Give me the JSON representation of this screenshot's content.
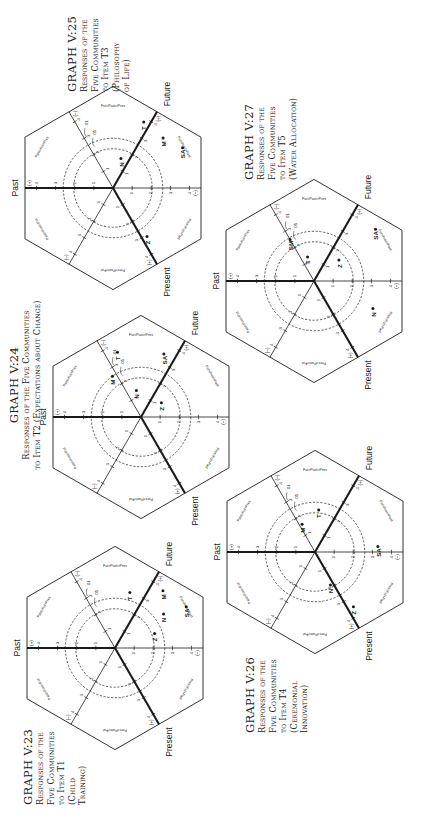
{
  "page": {
    "orientation": "rotated-90-ccw",
    "background": "#ffffff",
    "ink": "#1a1a1a"
  },
  "axes": {
    "past_label": "Past",
    "present_label": "Present",
    "future_label": "Future",
    "plus_marker": "(+)",
    "minus_marker": "(–)",
    "tick_labels": [
      "1",
      "2",
      "3",
      "4"
    ],
    "circle_01_label": ".01",
    "circle_05_label": ".05",
    "sector_labels": {
      "past_future_present": "Past>Fut>Pres",
      "future_past_present": "Fut>Past>Pres",
      "future_present_past": "Fut>Pres>Past",
      "present_future_past": "Pres>Fut>Past",
      "present_past_future": "Pres>Past>Fut",
      "past_present_future": "Past>Pres>Fut"
    }
  },
  "graphs": [
    {
      "id": "V:25",
      "title": "GRAPH V:25",
      "subtitle_lines": [
        "Responses of the",
        "Five Communities",
        "to Item T3",
        "(Philosophy",
        "of Life)"
      ]
    },
    {
      "id": "V:24",
      "title": "GRAPH V:24",
      "subtitle_lines": [
        "Responses of the Five Communities",
        "to Item T2 (Expectations about Change)"
      ]
    },
    {
      "id": "V:23",
      "title": "GRAPH V:23",
      "subtitle_lines": [
        "Responses of the",
        "Five Communities",
        "to Item T1",
        "(Child",
        "Training)"
      ]
    },
    {
      "id": "V:27",
      "title": "GRAPH V:27",
      "subtitle_lines": [
        "Responses of the",
        "Five Communities",
        "to Item T5",
        "(Water Allocation)"
      ]
    },
    {
      "id": "V:26",
      "title": "GRAPH V:26",
      "subtitle_lines": [
        "Responses of the",
        "Five Communities",
        "to Item T4",
        "(Ceremonial",
        "Innovation)"
      ]
    }
  ],
  "chart_data": [
    {
      "type": "scatter",
      "title": "GRAPH V:25 — Responses of the Five Communities to Item T3 (Philosophy of Life)",
      "axes": [
        "Past",
        "Future",
        "Present"
      ],
      "scale": [
        1,
        2,
        3,
        4
      ],
      "significance_circles": [
        ".05",
        ".01"
      ],
      "points": [
        {
          "label": "Z",
          "sector": "Past>Pres>Fut",
          "r": 3.1,
          "angle_deg": 215
        },
        {
          "label": "N",
          "sector": "Fut>Pres>Past",
          "r": 1.6,
          "angle_deg": 345
        },
        {
          "label": "SA",
          "sector": "Pres>Fut>Past",
          "r": 4.2,
          "angle_deg": 300
        },
        {
          "label": "M",
          "sector": "Pres>Fut>Past",
          "r": 3.7,
          "angle_deg": 315
        },
        {
          "label": "T",
          "sector": "Pres>Fut>Past",
          "r": 3.8,
          "angle_deg": 335
        }
      ]
    },
    {
      "type": "scatter",
      "title": "GRAPH V:24 — Responses of the Five Communities to Item T2 (Expectations about Change)",
      "axes": [
        "Past",
        "Future",
        "Present"
      ],
      "scale": [
        1,
        2,
        3,
        4
      ],
      "significance_circles": [
        ".05",
        ".01"
      ],
      "points": [
        {
          "label": "N",
          "sector": "Fut>Pres>Past",
          "r": 1.4,
          "angle_deg": 10
        },
        {
          "label": "M",
          "sector": "Fut>Pres>Past",
          "r": 2.6,
          "angle_deg": 35
        },
        {
          "label": "T",
          "sector": "Fut>Pres>Past",
          "r": 3.6,
          "angle_deg": 20
        },
        {
          "label": "Z",
          "sector": "Pres>Fut>Past",
          "r": 1.3,
          "angle_deg": 305
        },
        {
          "label": "SA",
          "sector": "Pres>Fut>Past",
          "r": 3.5,
          "angle_deg": 340
        }
      ]
    },
    {
      "type": "scatter",
      "title": "GRAPH V:23 — Responses of the Five Communities to Item T1 (Child Training)",
      "axes": [
        "Past",
        "Future",
        "Present"
      ],
      "scale": [
        1,
        2,
        3,
        4
      ],
      "significance_circles": [
        ".05",
        ".01"
      ],
      "points": [
        {
          "label": "Z",
          "sector": "Pres>Fut>Past",
          "r": 2.2,
          "angle_deg": 290
        },
        {
          "label": "N",
          "sector": "Pres>Fut>Past",
          "r": 3.1,
          "angle_deg": 305
        },
        {
          "label": "SA",
          "sector": "Pres>Fut>Past",
          "r": 4.3,
          "angle_deg": 300
        },
        {
          "label": "M",
          "sector": "Pres>Fut>Past",
          "r": 3.9,
          "angle_deg": 320
        },
        {
          "label": "T",
          "sector": "Fut>Pres>Past",
          "r": 3.0,
          "angle_deg": 345
        }
      ]
    },
    {
      "type": "scatter",
      "title": "GRAPH V:27 — Responses of the Five Communities to Item T5 (Water Allocation)",
      "axes": [
        "Past",
        "Future",
        "Present"
      ],
      "scale": [
        1,
        2,
        3,
        4
      ],
      "significance_circles": [
        ".05",
        ".01"
      ],
      "points": [
        {
          "label": "SM",
          "sector": "Fut>Pres>Past",
          "r": 2.5,
          "angle_deg": 30
        },
        {
          "label": "T",
          "sector": "Fut>Pres>Past",
          "r": 1.3,
          "angle_deg": 15
        },
        {
          "label": "Z",
          "sector": "Pres>Fut>Past",
          "r": 1.7,
          "angle_deg": 310
        },
        {
          "label": "N",
          "sector": "Pres>Past>Fut",
          "r": 3.4,
          "angle_deg": 245
        },
        {
          "label": "SA",
          "sector": "Pres>Fut>Past",
          "r": 4.2,
          "angle_deg": 310
        }
      ]
    },
    {
      "type": "scatter",
      "title": "GRAPH V:26 — Responses of the Five Communities to Item T4 (Ceremonial Innovation)",
      "axes": [
        "Past",
        "Future",
        "Present"
      ],
      "scale": [
        1,
        2,
        3,
        4
      ],
      "significance_circles": [
        ".05",
        ".01"
      ],
      "points": [
        {
          "label": "M",
          "sector": "Fut>Pres>Past",
          "r": 1.6,
          "angle_deg": 25
        },
        {
          "label": "T",
          "sector": "Fut>Pres>Past",
          "r": 2.2,
          "angle_deg": 355
        },
        {
          "label": "N",
          "sector": "Past>Pres>Fut",
          "r": 1.9,
          "angle_deg": 205
        },
        {
          "label": "Z",
          "sector": "Past>Pres>Fut",
          "r": 3.5,
          "angle_deg": 215
        },
        {
          "label": "SA",
          "sector": "Pres>Past>Fut",
          "r": 3.3,
          "angle_deg": 275
        }
      ]
    }
  ]
}
